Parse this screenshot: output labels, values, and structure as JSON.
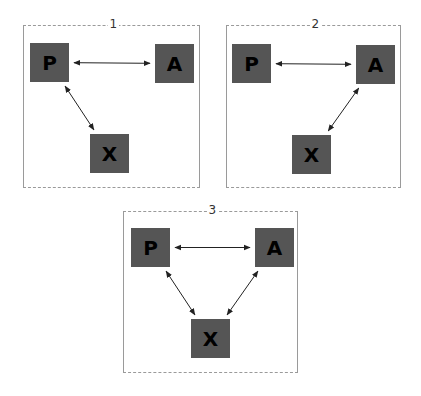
{
  "colors": {
    "node_fill": "#555555",
    "node_text": "#000000",
    "border": "#9a9a9a",
    "arrow": "#222222"
  },
  "panels": [
    {
      "label": "1",
      "box": {
        "x": 23,
        "y": 25,
        "w": 177,
        "h": 163
      },
      "nodes": [
        {
          "id": "P",
          "label": "P",
          "x": 30,
          "y": 43
        },
        {
          "id": "A",
          "label": "A",
          "x": 155,
          "y": 44
        },
        {
          "id": "X",
          "label": "X",
          "x": 90,
          "y": 134
        }
      ],
      "edges": [
        [
          "P",
          "A"
        ],
        [
          "P",
          "X"
        ]
      ]
    },
    {
      "label": "2",
      "box": {
        "x": 226,
        "y": 25,
        "w": 175,
        "h": 163
      },
      "nodes": [
        {
          "id": "P",
          "label": "P",
          "x": 232,
          "y": 44
        },
        {
          "id": "A",
          "label": "A",
          "x": 356,
          "y": 45
        },
        {
          "id": "X",
          "label": "X",
          "x": 292,
          "y": 135
        }
      ],
      "edges": [
        [
          "P",
          "A"
        ],
        [
          "A",
          "X"
        ]
      ]
    },
    {
      "label": "3",
      "box": {
        "x": 123,
        "y": 211,
        "w": 175,
        "h": 162
      },
      "nodes": [
        {
          "id": "P",
          "label": "P",
          "x": 131,
          "y": 228
        },
        {
          "id": "A",
          "label": "A",
          "x": 255,
          "y": 228
        },
        {
          "id": "X",
          "label": "X",
          "x": 191,
          "y": 319
        }
      ],
      "edges": [
        [
          "P",
          "A"
        ],
        [
          "P",
          "X"
        ],
        [
          "A",
          "X"
        ]
      ]
    }
  ]
}
